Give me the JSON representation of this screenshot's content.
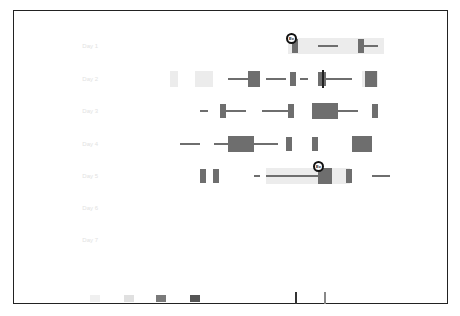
{
  "chart_data": {
    "type": "timeline",
    "title": "",
    "xlabel": "Time of day",
    "ylabel": "Date",
    "rows": [
      {
        "label": "Day 1",
        "y": 46
      },
      {
        "label": "Day 2",
        "y": 79
      },
      {
        "label": "Day 3",
        "y": 111
      },
      {
        "label": "Day 4",
        "y": 144
      },
      {
        "label": "Day 5",
        "y": 176
      },
      {
        "label": "Day 6",
        "y": 208
      },
      {
        "label": "Day 7",
        "y": 240
      }
    ],
    "x_ticks": [
      "",
      "",
      "",
      "",
      "",
      "",
      "",
      "",
      "",
      "",
      "",
      "",
      "",
      ""
    ],
    "legend": [
      {
        "label": "",
        "color": "#eeeeee"
      },
      {
        "label": "",
        "color": "#d0d0d0"
      },
      {
        "label": "",
        "color": "#7a7a7a"
      },
      {
        "label": "",
        "color": "#555555"
      },
      {
        "label": "",
        "color": "#222222"
      }
    ],
    "segments": [
      {
        "row": 0,
        "x": 288,
        "w": 96,
        "kind": "light"
      },
      {
        "row": 0,
        "x": 292,
        "w": 6,
        "kind": "dark",
        "h": 14
      },
      {
        "row": 0,
        "x": 318,
        "w": 20,
        "kind": "line"
      },
      {
        "row": 0,
        "x": 358,
        "w": 6,
        "kind": "dark",
        "h": 14
      },
      {
        "row": 0,
        "x": 364,
        "w": 14,
        "kind": "line"
      },
      {
        "row": 1,
        "x": 170,
        "w": 8,
        "kind": "light"
      },
      {
        "row": 1,
        "x": 195,
        "w": 18,
        "kind": "light"
      },
      {
        "row": 1,
        "x": 228,
        "w": 20,
        "kind": "line"
      },
      {
        "row": 1,
        "x": 248,
        "w": 12,
        "kind": "dark",
        "h": 16
      },
      {
        "row": 1,
        "x": 266,
        "w": 20,
        "kind": "line"
      },
      {
        "row": 1,
        "x": 290,
        "w": 6,
        "kind": "dark",
        "h": 14
      },
      {
        "row": 1,
        "x": 300,
        "w": 8,
        "kind": "line"
      },
      {
        "row": 1,
        "x": 318,
        "w": 8,
        "kind": "dark",
        "h": 14
      },
      {
        "row": 1,
        "x": 322,
        "w": 2,
        "kind": "black",
        "h": 18
      },
      {
        "row": 1,
        "x": 326,
        "w": 26,
        "kind": "line"
      },
      {
        "row": 1,
        "x": 362,
        "w": 16,
        "kind": "light"
      },
      {
        "row": 1,
        "x": 365,
        "w": 12,
        "kind": "dark",
        "h": 16
      },
      {
        "row": 2,
        "x": 200,
        "w": 8,
        "kind": "line"
      },
      {
        "row": 2,
        "x": 220,
        "w": 6,
        "kind": "dark",
        "h": 14
      },
      {
        "row": 2,
        "x": 226,
        "w": 20,
        "kind": "line"
      },
      {
        "row": 2,
        "x": 262,
        "w": 26,
        "kind": "line"
      },
      {
        "row": 2,
        "x": 288,
        "w": 6,
        "kind": "dark",
        "h": 14
      },
      {
        "row": 2,
        "x": 312,
        "w": 26,
        "kind": "dark",
        "h": 16
      },
      {
        "row": 2,
        "x": 338,
        "w": 20,
        "kind": "line"
      },
      {
        "row": 2,
        "x": 372,
        "w": 6,
        "kind": "dark",
        "h": 14
      },
      {
        "row": 3,
        "x": 180,
        "w": 20,
        "kind": "line"
      },
      {
        "row": 3,
        "x": 214,
        "w": 14,
        "kind": "line"
      },
      {
        "row": 3,
        "x": 228,
        "w": 26,
        "kind": "dark",
        "h": 16
      },
      {
        "row": 3,
        "x": 254,
        "w": 24,
        "kind": "line"
      },
      {
        "row": 3,
        "x": 286,
        "w": 6,
        "kind": "dark",
        "h": 14
      },
      {
        "row": 3,
        "x": 312,
        "w": 6,
        "kind": "dark",
        "h": 14
      },
      {
        "row": 3,
        "x": 352,
        "w": 20,
        "kind": "dark",
        "h": 16
      },
      {
        "row": 4,
        "x": 200,
        "w": 6,
        "kind": "dark",
        "h": 14
      },
      {
        "row": 4,
        "x": 213,
        "w": 6,
        "kind": "dark",
        "h": 14
      },
      {
        "row": 4,
        "x": 254,
        "w": 6,
        "kind": "line"
      },
      {
        "row": 4,
        "x": 266,
        "w": 84,
        "kind": "light"
      },
      {
        "row": 4,
        "x": 266,
        "w": 52,
        "kind": "line"
      },
      {
        "row": 4,
        "x": 318,
        "w": 14,
        "kind": "dark",
        "h": 16
      },
      {
        "row": 4,
        "x": 346,
        "w": 6,
        "kind": "dark",
        "h": 14
      },
      {
        "row": 4,
        "x": 372,
        "w": 18,
        "kind": "line"
      }
    ],
    "markers": [
      {
        "x": 286,
        "y": 33,
        "label": "Ev"
      },
      {
        "x": 313,
        "y": 161,
        "label": "Ev"
      }
    ]
  }
}
